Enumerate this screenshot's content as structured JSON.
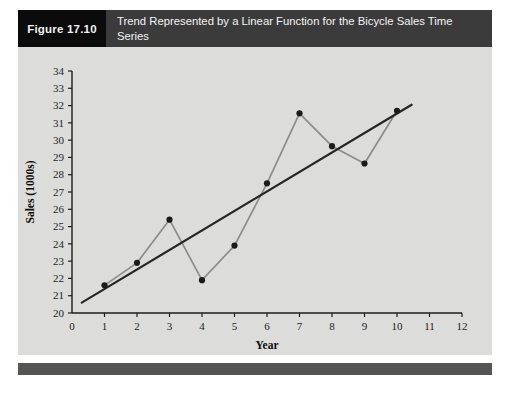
{
  "figure": {
    "tag": "Figure 17.10",
    "title": "Trend Represented by a Linear Function for the Bicycle Sales Time Series"
  },
  "colors": {
    "header_tag_bg": "#0b0b0b",
    "header_title_bg": "#3b3b3b",
    "header_text": "#f4f4f4",
    "panel_bg": "#dcdcda",
    "bottom_rule": "#555553",
    "series_line": "#8c8c8c",
    "marker": "#1b1b1b",
    "trend_line": "#262626",
    "axis": "#1c1c1c"
  },
  "chart_data": {
    "type": "line",
    "title": "Trend Represented by a Linear Function for the Bicycle Sales Time Series",
    "xlabel": "Year",
    "ylabel": "Sales (1000s)",
    "xlim": [
      0,
      12
    ],
    "ylim": [
      20,
      34
    ],
    "grid": false,
    "legend": "none",
    "xticks": [
      0,
      1,
      2,
      3,
      4,
      5,
      6,
      7,
      8,
      9,
      10,
      11,
      12
    ],
    "xtick_labels": [
      "0",
      "1",
      "2",
      "3",
      "4",
      "5",
      "6",
      "7",
      "8",
      "9",
      "10",
      "11",
      "12"
    ],
    "yticks": [
      20,
      21,
      22,
      23,
      24,
      25,
      26,
      27,
      28,
      29,
      30,
      31,
      32,
      33,
      34
    ],
    "ytick_labels": [
      "20",
      "21",
      "22",
      "23",
      "24",
      "25",
      "26",
      "27",
      "28",
      "29",
      "30",
      "31",
      "32",
      "33",
      "34"
    ],
    "x": [
      1,
      2,
      3,
      4,
      5,
      6,
      7,
      8,
      9,
      10
    ],
    "series": [
      {
        "name": "Bicycle Sales",
        "type": "line-markers",
        "values": [
          21.6,
          22.9,
          25.4,
          21.9,
          23.9,
          27.5,
          31.55,
          29.65,
          28.65,
          31.7
        ]
      },
      {
        "name": "Linear Trend",
        "type": "trend",
        "x_range": [
          0.3,
          10.45
        ],
        "y_range": [
          20.6,
          32.05
        ]
      }
    ]
  }
}
